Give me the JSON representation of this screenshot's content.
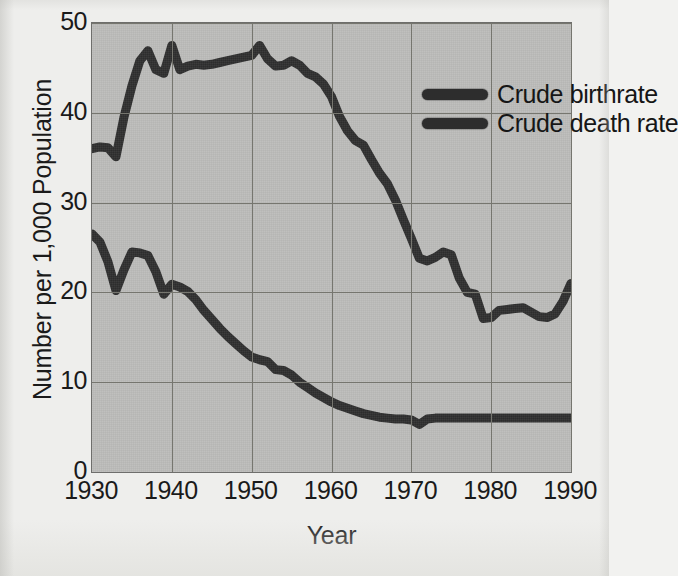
{
  "chart_data": {
    "type": "line",
    "title": "",
    "xlabel": "Year",
    "ylabel": "Number per 1,000 Population",
    "xlim": [
      1930,
      1990
    ],
    "ylim": [
      0,
      50
    ],
    "xticks": [
      "1930",
      "1940",
      "1950",
      "1960",
      "1970",
      "1980",
      "1990"
    ],
    "yticks": [
      "0",
      "10",
      "20",
      "30",
      "40",
      "50"
    ],
    "grid": true,
    "legend_position": "top-right-inside",
    "plot_background_color": "#bcbcba",
    "line_color": "#2e2e2e",
    "gridline_color": "#76766f",
    "series": [
      {
        "name": "Crude birthrate",
        "x": [
          1930,
          1931,
          1932,
          1933,
          1934,
          1935,
          1936,
          1937,
          1938,
          1939,
          1940,
          1941,
          1942,
          1943,
          1944,
          1945,
          1946,
          1947,
          1948,
          1949,
          1950,
          1951,
          1952,
          1953,
          1954,
          1955,
          1956,
          1957,
          1958,
          1959,
          1960,
          1961,
          1962,
          1963,
          1964,
          1965,
          1966,
          1967,
          1968,
          1969,
          1970,
          1971,
          1972,
          1973,
          1974,
          1975,
          1976,
          1977,
          1978,
          1979,
          1980,
          1981,
          1982,
          1983,
          1984,
          1985,
          1986,
          1987,
          1988,
          1989,
          1990
        ],
        "values": [
          36.0,
          36.2,
          36.1,
          35.1,
          39.5,
          43.0,
          45.8,
          46.9,
          44.8,
          44.4,
          47.5,
          44.8,
          45.2,
          45.4,
          45.3,
          45.4,
          45.6,
          45.8,
          46.0,
          46.2,
          46.4,
          47.5,
          46.0,
          45.2,
          45.3,
          45.8,
          45.3,
          44.4,
          44.0,
          43.2,
          41.8,
          39.6,
          38.0,
          36.9,
          36.4,
          34.8,
          33.3,
          32.1,
          30.3,
          28.1,
          26.0,
          23.8,
          23.5,
          23.9,
          24.5,
          24.2,
          21.6,
          20.0,
          19.8,
          17.1,
          17.2,
          18.0,
          18.1,
          18.2,
          18.3,
          17.8,
          17.3,
          17.2,
          17.6,
          19.0,
          21.0
        ]
      },
      {
        "name": "Crude death rate",
        "x": [
          1930,
          1931,
          1932,
          1933,
          1934,
          1935,
          1936,
          1937,
          1938,
          1939,
          1940,
          1941,
          1942,
          1943,
          1944,
          1945,
          1946,
          1947,
          1948,
          1949,
          1950,
          1951,
          1952,
          1953,
          1954,
          1955,
          1956,
          1957,
          1958,
          1959,
          1960,
          1961,
          1962,
          1963,
          1964,
          1965,
          1966,
          1967,
          1968,
          1969,
          1970,
          1971,
          1972,
          1973,
          1974,
          1975,
          1976,
          1977,
          1978,
          1979,
          1980,
          1981,
          1982,
          1983,
          1984,
          1985,
          1986,
          1987,
          1988,
          1989,
          1990
        ],
        "values": [
          26.5,
          25.6,
          23.4,
          20.2,
          22.5,
          24.5,
          24.4,
          24.1,
          22.3,
          19.8,
          20.9,
          20.6,
          20.1,
          19.2,
          18.0,
          17.0,
          16.0,
          15.1,
          14.3,
          13.5,
          12.8,
          12.5,
          12.3,
          11.4,
          11.3,
          10.8,
          10.0,
          9.4,
          8.8,
          8.3,
          7.8,
          7.4,
          7.1,
          6.8,
          6.5,
          6.3,
          6.1,
          6.0,
          5.9,
          5.9,
          5.8,
          5.3,
          5.9,
          6.0,
          6.0,
          6.0,
          6.0,
          6.0,
          6.0,
          6.0,
          6.0,
          6.0,
          6.0,
          6.0,
          6.0,
          6.0,
          6.0,
          6.0,
          6.0,
          6.0,
          6.0
        ]
      }
    ]
  },
  "axes": {
    "ylabel": "Number per 1,000 Population",
    "xlabel": "Year",
    "yticks": [
      "50",
      "40",
      "30",
      "20",
      "10",
      "0"
    ],
    "xticks": [
      "1930",
      "1940",
      "1950",
      "1960",
      "1970",
      "1980",
      "1990"
    ]
  },
  "legend": {
    "items": [
      {
        "label": "Crude birthrate",
        "color": "#2e2e2e"
      },
      {
        "label": "Crude death rate",
        "color": "#2e2e2e"
      }
    ]
  }
}
